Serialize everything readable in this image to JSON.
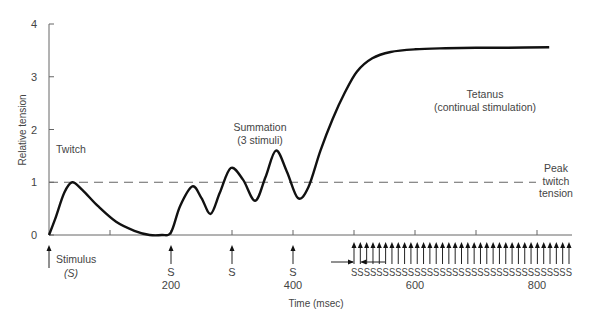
{
  "chart_data": {
    "type": "line",
    "title": "",
    "xlabel": "Time (msec)",
    "ylabel": "Relative tension",
    "xlim": [
      0,
      850
    ],
    "ylim": [
      0,
      4
    ],
    "x_ticks": [
      0,
      100,
      200,
      300,
      400,
      500,
      600,
      700,
      800
    ],
    "x_tick_labels": [
      {
        "x": 200,
        "label": "200"
      },
      {
        "x": 400,
        "label": "400"
      },
      {
        "x": 600,
        "label": "600"
      },
      {
        "x": 800,
        "label": "800"
      }
    ],
    "y_ticks": [
      0,
      1,
      2,
      3,
      4
    ],
    "y_tick_labels": [
      "0",
      "1",
      "2",
      "3",
      "4"
    ],
    "grid": false,
    "series": [
      {
        "name": "Tension",
        "x": [
          0,
          10,
          25,
          38,
          55,
          80,
          110,
          140,
          165,
          185,
          200,
          215,
          235,
          250,
          265,
          280,
          298,
          318,
          338,
          355,
          372,
          390,
          408,
          425,
          445,
          465,
          485,
          505,
          530,
          560,
          600,
          650,
          700,
          750,
          820
        ],
        "y": [
          0,
          0.3,
          0.8,
          1.0,
          0.85,
          0.55,
          0.25,
          0.08,
          0.0,
          0.0,
          0.05,
          0.55,
          0.92,
          0.7,
          0.4,
          0.8,
          1.27,
          1.05,
          0.65,
          1.1,
          1.6,
          1.2,
          0.7,
          0.9,
          1.6,
          2.2,
          2.7,
          3.1,
          3.35,
          3.47,
          3.52,
          3.54,
          3.55,
          3.55,
          3.56
        ]
      }
    ],
    "reference_line": {
      "y": 1.0,
      "style": "dashed",
      "label": "Peak twitch tension"
    },
    "annotations": [
      {
        "text": "Twitch",
        "x": 15,
        "y": 1.7
      },
      {
        "text": "Summation",
        "x": 280,
        "y": 1.6
      },
      {
        "text": "(3 stimuli)",
        "x": 280,
        "y": 1.4
      },
      {
        "text": "Tetanus",
        "x": 660,
        "y": 2.6
      },
      {
        "text": "(continual stimulation)",
        "x": 660,
        "y": 2.4
      },
      {
        "text": "Peak",
        "x": 860,
        "y": 1.2
      },
      {
        "text": "twitch",
        "x": 860,
        "y": 1.0
      },
      {
        "text": "tension",
        "x": 860,
        "y": 0.8
      }
    ],
    "stimuli": {
      "single": [
        0,
        200,
        300,
        400
      ],
      "tetanus_start": 500,
      "tetanus_end": 855,
      "tetanus_count": 35,
      "symbol": "S",
      "first_label": "Stimulus",
      "first_sub": "(S)"
    }
  }
}
